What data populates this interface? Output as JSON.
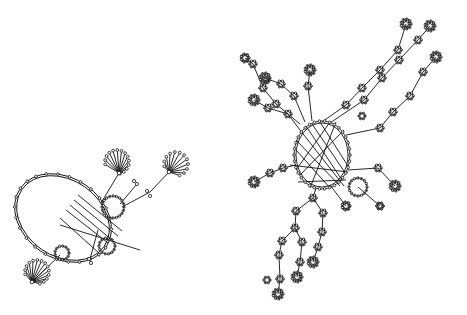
{
  "diagram": {
    "type": "network-graph",
    "background": "#ffffff",
    "stroke_color": "#111111",
    "components": [
      {
        "name": "left-component",
        "hub_ring": {
          "cx": 63,
          "cy": 218,
          "rx": 52,
          "ry": 40,
          "rotate": 35
        },
        "rings": [
          {
            "cx": 113,
            "cy": 207,
            "r": 11
          },
          {
            "cx": 107,
            "cy": 246,
            "r": 8
          },
          {
            "cx": 62,
            "cy": 253,
            "r": 7
          }
        ],
        "stars": [
          {
            "cx": 117,
            "cy": 162,
            "r": 12,
            "spokes": 14,
            "hubx": 119,
            "huby": 173
          },
          {
            "cx": 176,
            "cy": 164,
            "r": 12,
            "spokes": 12,
            "hubx": 169,
            "huby": 172
          },
          {
            "cx": 37,
            "cy": 272,
            "r": 12,
            "spokes": 14,
            "hubx": 32,
            "huby": 282
          }
        ],
        "small_nodes": [
          {
            "x": 147,
            "y": 191
          },
          {
            "x": 150,
            "y": 196
          },
          {
            "x": 137,
            "y": 184
          },
          {
            "x": 134,
            "y": 181
          },
          {
            "x": 89,
            "y": 259
          },
          {
            "x": 91,
            "y": 263
          }
        ],
        "edges": [
          [
            119,
            173,
            101,
            203
          ],
          [
            169,
            172,
            150,
            192
          ],
          [
            150,
            192,
            122,
            207
          ],
          [
            137,
            184,
            120,
            204
          ],
          [
            32,
            282,
            60,
            255
          ],
          [
            90,
            259,
            98,
            230
          ],
          [
            70,
            205,
            112,
            240
          ],
          [
            74,
            200,
            118,
            236
          ],
          [
            78,
            195,
            122,
            231
          ],
          [
            66,
            210,
            108,
            243
          ],
          [
            60,
            218,
            100,
            254
          ],
          [
            60,
            225,
            140,
            250
          ]
        ]
      },
      {
        "name": "right-component",
        "hub_ring": {
          "cx": 322,
          "cy": 155,
          "rx": 28,
          "ry": 34,
          "rotate": 0
        },
        "rings": [
          {
            "cx": 358,
            "cy": 187,
            "r": 9
          }
        ],
        "branches": [
          {
            "name": "upper-right-branch-1",
            "points": [
              [
                322,
                122
              ],
              [
                346,
                105
              ],
              [
                362,
                88
              ],
              [
                380,
                70
              ],
              [
                398,
                50
              ],
              [
                406,
                24
              ]
            ]
          },
          {
            "name": "upper-right-branch-2",
            "points": [
              [
                330,
                123
              ],
              [
                364,
                100
              ],
              [
                382,
                78
              ],
              [
                399,
                60
              ],
              [
                418,
                40
              ],
              [
                430,
                26
              ]
            ]
          },
          {
            "name": "upper-right-branch-3",
            "points": [
              [
                346,
                135
              ],
              [
                380,
                128
              ],
              [
                393,
                112
              ],
              [
                410,
                96
              ],
              [
                423,
                72
              ],
              [
                436,
                57
              ]
            ]
          },
          {
            "name": "upper-left-branch-1",
            "points": [
              [
                300,
                124
              ],
              [
                276,
                104
              ],
              [
                263,
                88
              ],
              [
                253,
                64
              ],
              [
                245,
                58
              ]
            ]
          },
          {
            "name": "upper-left-branch-2",
            "points": [
              [
                305,
                122
              ],
              [
                294,
                96
              ],
              [
                281,
                84
              ],
              [
                265,
                78
              ]
            ]
          },
          {
            "name": "upper-left-branch-3",
            "points": [
              [
                312,
                121
              ],
              [
                308,
                86
              ],
              [
                310,
                70
              ]
            ]
          },
          {
            "name": "upper-left-branch-4",
            "points": [
              [
                300,
                130
              ],
              [
                288,
                114
              ],
              [
                268,
                108
              ],
              [
                254,
                100
              ]
            ]
          },
          {
            "name": "left-branch",
            "points": [
              [
                296,
                165
              ],
              [
                283,
                168
              ],
              [
                270,
                173
              ],
              [
                254,
                182
              ]
            ]
          },
          {
            "name": "lower-branch-1",
            "points": [
              [
                316,
                188
              ],
              [
                313,
                198
              ],
              [
                296,
                211
              ],
              [
                295,
                228
              ],
              [
                282,
                241
              ],
              [
                279,
                255
              ],
              [
                280,
                279
              ],
              [
                278,
                294
              ]
            ]
          },
          {
            "name": "lower-branch-2",
            "points": [
              [
                313,
                198
              ],
              [
                323,
                213
              ],
              [
                322,
                232
              ],
              [
                318,
                247
              ],
              [
                313,
                262
              ]
            ]
          },
          {
            "name": "lower-branch-3",
            "points": [
              [
                295,
                228
              ],
              [
                302,
                242
              ],
              [
                300,
                262
              ],
              [
                297,
                277
              ]
            ]
          },
          {
            "name": "lower-right-branch",
            "points": [
              [
                330,
                185
              ],
              [
                346,
                206
              ]
            ]
          },
          {
            "name": "right-branch",
            "points": [
              [
                348,
                170
              ],
              [
                378,
                168
              ],
              [
                395,
                186
              ]
            ]
          },
          {
            "name": "right-branch-2",
            "points": [
              [
                358,
                187
              ],
              [
                380,
                206
              ]
            ]
          }
        ],
        "cross_edges": [
          [
            300,
            130,
            344,
            186
          ],
          [
            306,
            126,
            342,
            180
          ],
          [
            312,
            124,
            346,
            174
          ],
          [
            320,
            122,
            348,
            166
          ],
          [
            296,
            140,
            340,
            186
          ],
          [
            300,
            175,
            344,
            130
          ],
          [
            296,
            170,
            330,
            122
          ],
          [
            310,
            188,
            336,
            122
          ],
          [
            296,
            150,
            330,
            188
          ],
          [
            290,
            165,
            348,
            172
          ],
          [
            298,
            182,
            346,
            180
          ]
        ],
        "leaf_nodes": [
          {
            "x": 406,
            "y": 24,
            "r": 5
          },
          {
            "x": 430,
            "y": 26,
            "r": 5
          },
          {
            "x": 436,
            "y": 57,
            "r": 5
          },
          {
            "x": 245,
            "y": 58,
            "r": 4
          },
          {
            "x": 265,
            "y": 78,
            "r": 5
          },
          {
            "x": 310,
            "y": 70,
            "r": 5
          },
          {
            "x": 254,
            "y": 100,
            "r": 5
          },
          {
            "x": 254,
            "y": 182,
            "r": 5
          },
          {
            "x": 278,
            "y": 294,
            "r": 5
          },
          {
            "x": 313,
            "y": 262,
            "r": 5
          },
          {
            "x": 297,
            "y": 277,
            "r": 5
          },
          {
            "x": 395,
            "y": 186,
            "r": 5
          },
          {
            "x": 346,
            "y": 206,
            "r": 4
          },
          {
            "x": 380,
            "y": 206,
            "r": 3
          },
          {
            "x": 267,
            "y": 280,
            "r": 3
          },
          {
            "x": 362,
            "y": 116,
            "r": 3
          },
          {
            "x": 266,
            "y": 80,
            "r": 3
          }
        ]
      }
    ]
  }
}
